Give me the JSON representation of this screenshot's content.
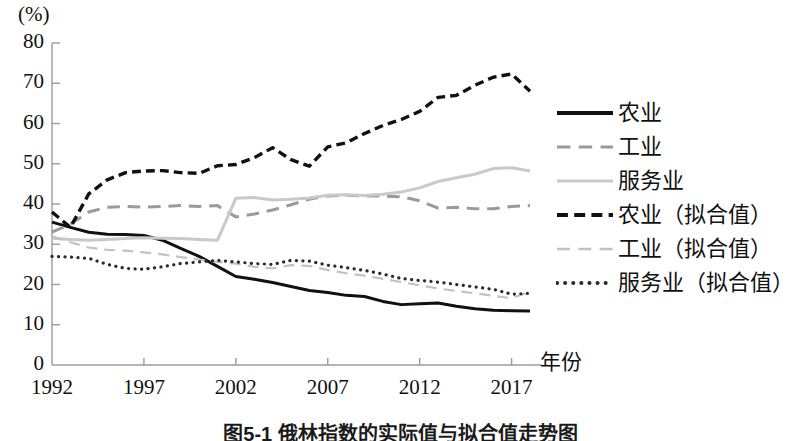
{
  "figure": {
    "y_unit_label": "(%)",
    "x_axis_title": "年份",
    "caption": "图5-1  俄林指数的实际值与拟合值走势图"
  },
  "chart_data": {
    "type": "line",
    "title": "",
    "subtitle": "",
    "xlabel": "年份",
    "ylabel": "(%)",
    "ylim": [
      0,
      80
    ],
    "xlim": [
      1992,
      2018
    ],
    "grid": false,
    "legend_position": "right",
    "ytick_labels": [
      "0",
      "10",
      "20",
      "30",
      "40",
      "50",
      "60",
      "70",
      "80"
    ],
    "ytick_values": [
      0,
      10,
      20,
      30,
      40,
      50,
      60,
      70,
      80
    ],
    "xtick_labels": [
      "1992",
      "1997",
      "2002",
      "2007",
      "2012",
      "2017"
    ],
    "xtick_values": [
      1992,
      1997,
      2002,
      2007,
      2012,
      2017
    ],
    "x": [
      1992,
      1993,
      1994,
      1995,
      1996,
      1997,
      1998,
      1999,
      2000,
      2001,
      2002,
      2003,
      2004,
      2005,
      2006,
      2007,
      2008,
      2009,
      2010,
      2011,
      2012,
      2013,
      2014,
      2015,
      2016,
      2017,
      2018
    ],
    "series": [
      {
        "name": "农业",
        "style": "solid",
        "color": "#111111",
        "width": 3.0,
        "values": [
          35.5,
          34.2,
          33.0,
          32.5,
          32.4,
          32.2,
          31.0,
          29.0,
          27.0,
          24.5,
          22.0,
          21.3,
          20.5,
          19.5,
          18.5,
          18.0,
          17.3,
          17.0,
          15.8,
          15.0,
          15.2,
          15.4,
          14.6,
          14.0,
          13.6,
          13.5,
          13.4
        ]
      },
      {
        "name": "工业",
        "style": "dashed",
        "color": "#9a9a9a",
        "width": 3.0,
        "values": [
          33.0,
          35.0,
          38.0,
          39.2,
          39.4,
          39.2,
          39.4,
          39.6,
          39.4,
          39.6,
          36.8,
          37.5,
          38.5,
          39.8,
          41.2,
          42.0,
          42.2,
          42.0,
          42.0,
          41.8,
          40.8,
          39.0,
          39.2,
          38.8,
          38.8,
          39.4,
          39.6
        ]
      },
      {
        "name": "服务业",
        "style": "solid",
        "color": "#c9c9c9",
        "width": 3.0,
        "values": [
          31.5,
          31.2,
          31.0,
          31.2,
          31.4,
          31.6,
          31.5,
          31.4,
          31.2,
          31.0,
          41.4,
          41.6,
          41.0,
          41.2,
          41.5,
          42.2,
          42.3,
          42.1,
          42.4,
          43.0,
          44.0,
          45.6,
          46.5,
          47.4,
          48.8,
          49.0,
          48.2
        ]
      },
      {
        "name": "农业（拟合值）",
        "style": "dashed-heavy",
        "color": "#111111",
        "width": 3.4,
        "values": [
          38.0,
          34.2,
          42.5,
          46.0,
          47.8,
          48.2,
          48.3,
          47.8,
          47.6,
          49.5,
          49.8,
          51.5,
          54.0,
          51.0,
          49.4,
          54.2,
          55.2,
          57.5,
          59.5,
          61.0,
          63.0,
          66.5,
          67.0,
          69.5,
          71.5,
          72.3,
          68.0
        ]
      },
      {
        "name": "工业（拟合值）",
        "style": "dashed-light",
        "color": "#c2c2c2",
        "width": 2.2,
        "values": [
          32.0,
          30.5,
          29.2,
          28.6,
          28.4,
          28.0,
          27.5,
          26.8,
          26.2,
          25.6,
          25.2,
          24.4,
          24.0,
          24.8,
          24.6,
          23.6,
          22.8,
          22.2,
          21.4,
          20.6,
          19.8,
          19.0,
          18.4,
          17.8,
          17.2,
          16.6,
          18.2
        ]
      },
      {
        "name": "服务业（拟合值）",
        "style": "dotted",
        "color": "#2b2b2b",
        "width": 3.2,
        "values": [
          27.0,
          26.8,
          26.5,
          25.0,
          24.0,
          23.8,
          24.4,
          25.2,
          25.6,
          26.0,
          25.6,
          25.2,
          25.0,
          26.0,
          25.8,
          24.8,
          24.2,
          23.5,
          22.6,
          21.5,
          21.0,
          20.6,
          20.0,
          19.4,
          18.8,
          17.6,
          17.8
        ]
      }
    ]
  },
  "legend": {
    "items": [
      {
        "label": "农业",
        "key": "solid-black-key",
        "color": "#111111",
        "style": "solid",
        "width": 4
      },
      {
        "label": "工业",
        "key": "dashed-gray-key",
        "color": "#9a9a9a",
        "style": "dashed",
        "width": 3.2
      },
      {
        "label": "服务业",
        "key": "solid-lightgray-key",
        "color": "#c9c9c9",
        "style": "solid",
        "width": 3.2
      },
      {
        "label": "农业（拟合值）",
        "key": "dashed-heavy-black-key",
        "color": "#111111",
        "style": "dashed-heavy",
        "width": 4.2
      },
      {
        "label": "工业（拟合值）",
        "key": "dashed-light-gray-key",
        "color": "#c2c2c2",
        "style": "dashed-light",
        "width": 2.6
      },
      {
        "label": "服务业（拟合值）",
        "key": "dotted-black-key",
        "color": "#2b2b2b",
        "style": "dotted",
        "width": 4
      }
    ]
  },
  "axis_geometry": {
    "origin_x": 52,
    "origin_y": 365,
    "top_y": 43,
    "right_x": 530,
    "px_per_year": 18.2,
    "px_per_unit": 4.025
  }
}
